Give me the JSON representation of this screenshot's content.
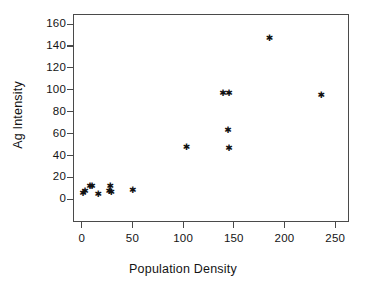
{
  "chart_data": {
    "type": "scatter",
    "title": "",
    "xlabel": "Population Density",
    "ylabel": "Ag Intensity",
    "xlim": [
      -10,
      262
    ],
    "ylim": [
      -9,
      169
    ],
    "xticks": [
      0,
      50,
      100,
      150,
      200,
      250
    ],
    "yticks": [
      0,
      20,
      40,
      60,
      80,
      100,
      120,
      140,
      160
    ],
    "grid": false,
    "legend": null,
    "marker": "asterisk",
    "marker_color": "#101010",
    "frame_color": "#4a4a4a",
    "background": "#ffffff",
    "points": [
      {
        "x": 1,
        "y": 5
      },
      {
        "x": 3,
        "y": 7
      },
      {
        "x": 8,
        "y": 12
      },
      {
        "x": 10,
        "y": 12
      },
      {
        "x": 16,
        "y": 4
      },
      {
        "x": 27,
        "y": 7
      },
      {
        "x": 28,
        "y": 12
      },
      {
        "x": 29,
        "y": 6
      },
      {
        "x": 50,
        "y": 8
      },
      {
        "x": 103,
        "y": 47
      },
      {
        "x": 139,
        "y": 97
      },
      {
        "x": 145,
        "y": 97
      },
      {
        "x": 144,
        "y": 63
      },
      {
        "x": 145,
        "y": 46
      },
      {
        "x": 185,
        "y": 147
      },
      {
        "x": 236,
        "y": 95
      }
    ]
  },
  "axes": {
    "x_tick_labels": [
      "0",
      "50",
      "100",
      "150",
      "200",
      "250"
    ],
    "y_tick_labels": [
      "0",
      "20",
      "40",
      "60",
      "80",
      "100",
      "120",
      "140",
      "160"
    ]
  }
}
